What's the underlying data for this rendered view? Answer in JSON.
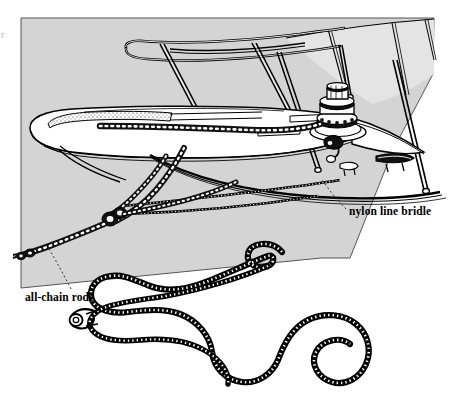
{
  "figure": {
    "kind": "technical-line-illustration",
    "canvas": {
      "width": 456,
      "height": 403
    },
    "background_color": "#ffffff",
    "ink_color": "#000000",
    "panel": {
      "name": "water-surface-panel",
      "fill_color": "#d4d4d4",
      "stroke_color": "#555555",
      "outline_points": "21,18 434,18 433,74 393,150 350,258 321,258 21,288"
    }
  },
  "labels": {
    "nylon_line_bridle": "nylon line bridle",
    "all_chain_rode": "all-chain rode"
  },
  "leaders": {
    "nylon_line_bridle": {
      "name": "nylon-line-bridle-leader",
      "style": "dashed",
      "points": "345,211 330,195 320,180"
    },
    "all_chain_rode": {
      "name": "all-chain-rode-leader",
      "style": "dashed",
      "points": "71,289 60,268 47,247"
    }
  },
  "edge_artifact": {
    "name": "page-edge-artifact",
    "text": "r",
    "color": "#b8b8b8"
  },
  "parts": [
    {
      "name": "bow-pulpit-rail",
      "label": "bow pulpit rail"
    },
    {
      "name": "stanchion",
      "label": "stanchion"
    },
    {
      "name": "lifeline",
      "label": "lifeline"
    },
    {
      "name": "foredeck",
      "label": "foredeck"
    },
    {
      "name": "anchor-windlass",
      "label": "anchor windlass"
    },
    {
      "name": "deck-cleat",
      "label": "deck cleat"
    },
    {
      "name": "bow-roller",
      "label": "bow roller"
    },
    {
      "name": "anchor-chain",
      "label": "anchor chain"
    },
    {
      "name": "chain-rode",
      "label": "all-chain rode"
    },
    {
      "name": "nylon-bridle-line",
      "label": "nylon line bridle"
    },
    {
      "name": "bridle-shackle",
      "label": "bridle shackle and thimble"
    }
  ]
}
